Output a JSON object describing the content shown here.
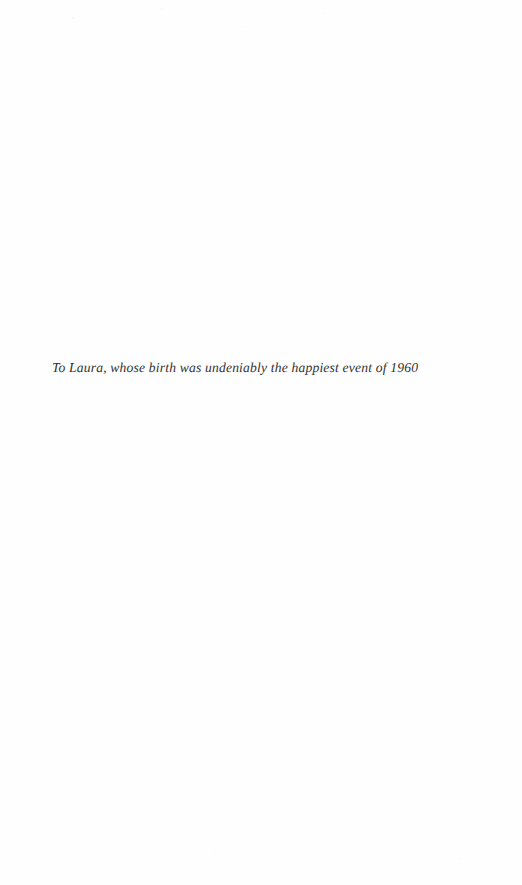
{
  "page": {
    "kind": "book-dedication-page",
    "background_color": "#fefefe",
    "text_color": "#1c1c20",
    "width_px": 522,
    "height_px": 885
  },
  "dedication": {
    "text": "To Laura, whose birth was undeniably the happiest event of 1960",
    "style": "italic",
    "alignment": "left",
    "left_margin_px": 52,
    "top_px": 344
  }
}
